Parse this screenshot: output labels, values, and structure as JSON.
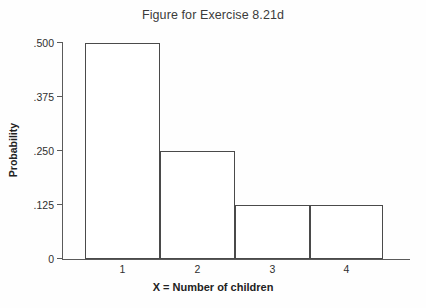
{
  "chart_data": {
    "type": "bar",
    "title": "Figure for Exercise 8.21d",
    "xlabel": "X = Number of children",
    "ylabel": "Probability",
    "categories": [
      "1",
      "2",
      "3",
      "4"
    ],
    "values": [
      0.5,
      0.25,
      0.125,
      0.125
    ],
    "ylim": [
      0,
      0.5
    ],
    "yticks": [
      0,
      0.125,
      0.25,
      0.375,
      0.5
    ],
    "ytick_labels": [
      "0",
      ".125",
      ".250",
      ".375",
      ".500"
    ],
    "xtick_labels": [
      "1",
      "2",
      "3",
      "4"
    ],
    "grid": false,
    "legend": null,
    "style": {
      "bar_fill": "#ffffff",
      "bar_edge": "#4a4a4a",
      "axis_color": "#5a5a5a",
      "text_color": "#2f2f2f",
      "title_color": "#3b3b3b",
      "background": "#fefefe"
    },
    "bar_style": "adjacent-histogram"
  },
  "axes": {
    "y_ticks": [
      {
        "label": ".500",
        "value": 0.5,
        "y": 42.5
      },
      {
        "label": ".375",
        "value": 0.375,
        "y": 96.6
      },
      {
        "label": ".250",
        "value": 0.25,
        "y": 150.7
      },
      {
        "label": ".125",
        "value": 0.125,
        "y": 204.8
      },
      {
        "label": "0",
        "value": 0,
        "y": 258.9
      }
    ],
    "x_ticks": [
      {
        "label": "1",
        "x": 122.5
      },
      {
        "label": "2",
        "x": 197.5
      },
      {
        "label": "3",
        "x": 272.5
      },
      {
        "label": "4",
        "x": 346.5
      }
    ]
  },
  "bars": [
    {
      "category": "1",
      "value": 0.5,
      "left": 85,
      "width": 75,
      "top": 42.5,
      "height": 216.4
    },
    {
      "category": "2",
      "value": 0.25,
      "left": 160,
      "width": 75,
      "top": 150.7,
      "height": 108.2
    },
    {
      "category": "3",
      "value": 0.125,
      "left": 235,
      "width": 75,
      "top": 204.8,
      "height": 54.1
    },
    {
      "category": "4",
      "value": 0.125,
      "left": 310,
      "width": 72.5,
      "top": 204.8,
      "height": 54.1
    }
  ]
}
